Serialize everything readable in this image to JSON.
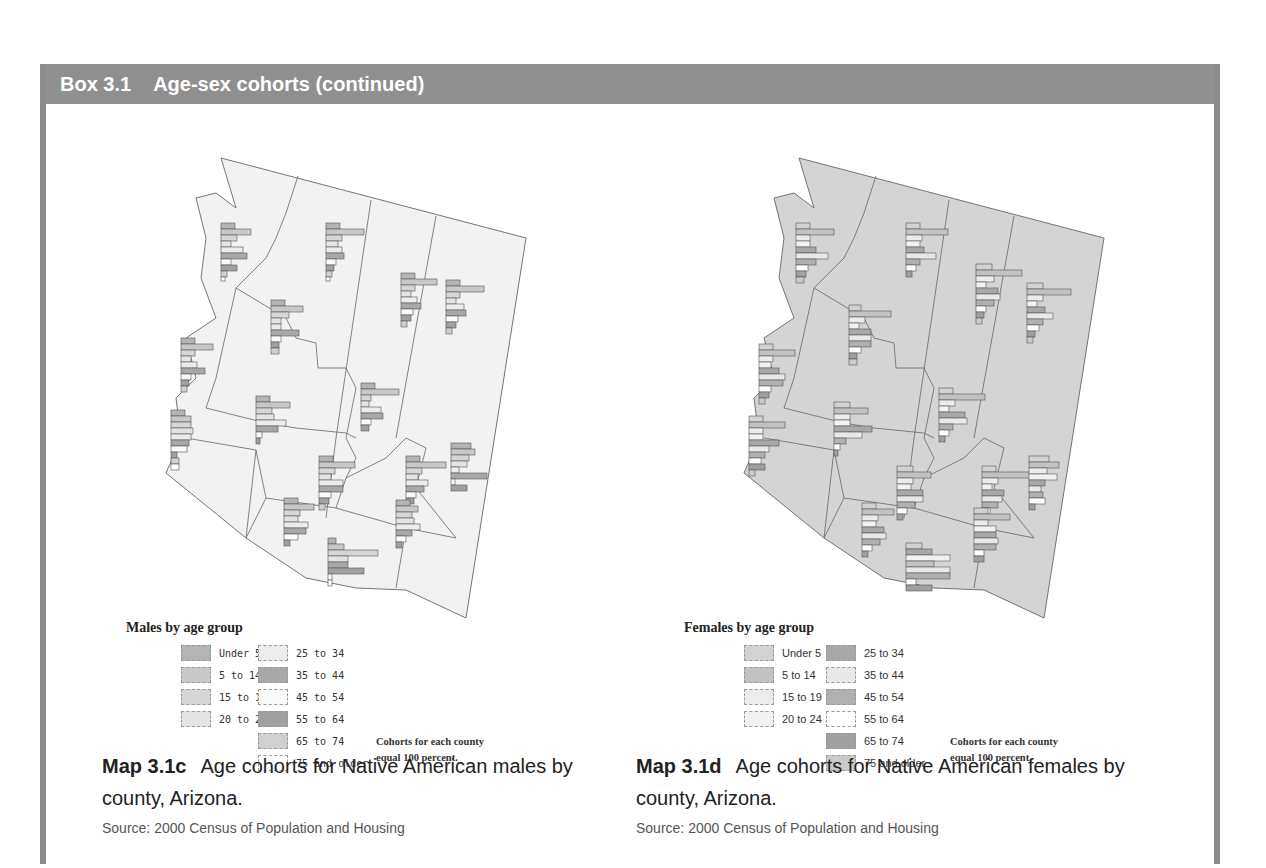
{
  "box": {
    "number": "Box 3.1",
    "title": "Age-sex cohorts (continued)",
    "header_color": "#8f8f8f",
    "border_color": "#8c8c8c"
  },
  "maps": [
    {
      "id": "Map 3.1c",
      "caption": "Age cohorts for Native American males by county, Arizona.",
      "source": "Source: 2000 Census of Population and Housing",
      "fill_color": "#f2f2f2",
      "legend": {
        "title": "Males by age group",
        "items": [
          {
            "label": "Under 5",
            "color": "#b4b4b4"
          },
          {
            "label": "5 to 14",
            "color": "#c8c8c8"
          },
          {
            "label": "15 to 19",
            "color": "#d6d6d6"
          },
          {
            "label": "20 to 24",
            "color": "#e4e4e4"
          },
          {
            "label": "25 to 34",
            "color": "#ececec"
          },
          {
            "label": "35 to 44",
            "color": "#a8a8a8"
          },
          {
            "label": "45 to 54",
            "color": "#fafafa"
          },
          {
            "label": "55 to 64",
            "color": "#a0a0a0"
          },
          {
            "label": "65 to 74",
            "color": "#d0d0d0"
          },
          {
            "label": "75 and older",
            "color": "#ffffff"
          }
        ],
        "note_line1": "Cohorts for each county",
        "note_line2": "equal 100 percent."
      }
    },
    {
      "id": "Map 3.1d",
      "caption": "Age cohorts for Native American females by county, Arizona.",
      "source": "Source: 2000 Census of Population and Housing",
      "fill_color": "#d4d4d4",
      "legend": {
        "title": "Females by age group",
        "items": [
          {
            "label": "Under 5",
            "color": "#d2d2d2"
          },
          {
            "label": "5 to 14",
            "color": "#c2c2c2"
          },
          {
            "label": "15 to 19",
            "color": "#ececec"
          },
          {
            "label": "20 to 24",
            "color": "#f2f2f2"
          },
          {
            "label": "25 to 34",
            "color": "#a8a8a8"
          },
          {
            "label": "35 to 44",
            "color": "#e8e8e8"
          },
          {
            "label": "45 to 54",
            "color": "#b0b0b0"
          },
          {
            "label": "55 to 64",
            "color": "#ffffff"
          },
          {
            "label": "65 to 74",
            "color": "#a0a0a0"
          },
          {
            "label": "75 and older",
            "color": "#cacaca"
          }
        ],
        "note_line1": "Cohorts for each county",
        "note_line2": "equal 100 percent."
      }
    }
  ]
}
